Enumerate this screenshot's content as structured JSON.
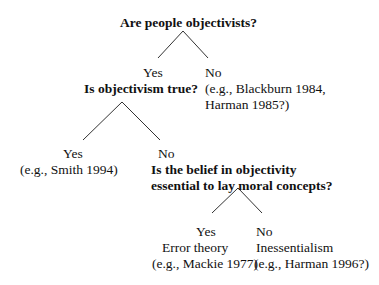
{
  "diagram": {
    "type": "decision-tree",
    "root": {
      "question": "Are people objectivists?",
      "yes": {
        "label": "Yes",
        "question": "Is objectivism true?",
        "yes": {
          "label": "Yes",
          "example": "(e.g., Smith 1994)"
        },
        "no": {
          "label": "No",
          "question_line1": "Is the belief in objectivity",
          "question_line2": "essential to lay moral concepts?",
          "yes": {
            "label": "Yes",
            "theory": "Error theory",
            "example": "(e.g., Mackie 1977)"
          },
          "no": {
            "label": "No",
            "theory": "Inessentialism",
            "example": "(e.g., Harman 1996?)"
          }
        }
      },
      "no": {
        "label": "No",
        "example_line1": "(e.g., Blackburn 1984,",
        "example_line2": "Harman 1985?)"
      }
    }
  },
  "colors": {
    "text": "#111111",
    "lines": "#333333",
    "background": "#ffffff"
  }
}
